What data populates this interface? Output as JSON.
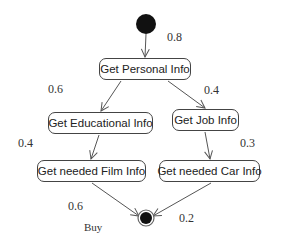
{
  "diagram": {
    "type": "activity",
    "start_node": {
      "cx": 146,
      "cy": 24,
      "r": 10
    },
    "end_node": {
      "cx": 146,
      "cy": 218,
      "r": 7
    },
    "activities": [
      {
        "id": "personal",
        "label": "Get Personal Info",
        "x": 99,
        "y": 58,
        "w": 92,
        "h": 22
      },
      {
        "id": "educational",
        "label": "Get Educational Info",
        "x": 48,
        "y": 112,
        "w": 105,
        "h": 22
      },
      {
        "id": "job",
        "label": "Get Job Info",
        "x": 172,
        "y": 109,
        "w": 67,
        "h": 22
      },
      {
        "id": "film",
        "label": "Get needed Film Info",
        "x": 37,
        "y": 160,
        "w": 109,
        "h": 22
      },
      {
        "id": "car",
        "label": "Get needed Car Info",
        "x": 159,
        "y": 160,
        "w": 101,
        "h": 22
      }
    ],
    "edge_labels": [
      {
        "text": "0.8",
        "x": 167,
        "y": 30
      },
      {
        "text": "0.6",
        "x": 48,
        "y": 82
      },
      {
        "text": "0.4",
        "x": 204,
        "y": 83
      },
      {
        "text": "0.4",
        "x": 18,
        "y": 136
      },
      {
        "text": "0.3",
        "x": 240,
        "y": 136
      },
      {
        "text": "0.6",
        "x": 68,
        "y": 199
      },
      {
        "text": "Buy",
        "x": 84,
        "y": 221,
        "small": true
      },
      {
        "text": "0.2",
        "x": 179,
        "y": 211
      }
    ],
    "edges": [
      {
        "from": "start",
        "to": "personal",
        "x1": 146,
        "y1": 34,
        "x2": 145,
        "y2": 57
      },
      {
        "from": "personal",
        "to": "educational",
        "x1": 121,
        "y1": 81,
        "x2": 101,
        "y2": 111
      },
      {
        "from": "personal",
        "to": "job",
        "x1": 168,
        "y1": 81,
        "x2": 205,
        "y2": 108
      },
      {
        "from": "educational",
        "to": "film",
        "x1": 99,
        "y1": 135,
        "x2": 91,
        "y2": 159
      },
      {
        "from": "job",
        "to": "car",
        "x1": 205,
        "y1": 132,
        "x2": 210,
        "y2": 159
      },
      {
        "from": "film",
        "to": "end",
        "x1": 92,
        "y1": 183,
        "x2": 139,
        "y2": 216
      },
      {
        "from": "car",
        "to": "end",
        "x1": 211,
        "y1": 183,
        "x2": 153,
        "y2": 216
      }
    ]
  }
}
